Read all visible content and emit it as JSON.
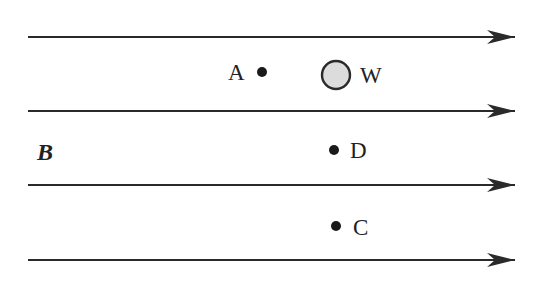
{
  "diagram": {
    "field_label": "B",
    "field_lines": [
      {
        "y": 37
      },
      {
        "y": 111
      },
      {
        "y": 185
      },
      {
        "y": 260
      }
    ],
    "wire": {
      "label": "W",
      "cx": 336,
      "cy": 75,
      "r": 14
    },
    "points": [
      {
        "label": "A",
        "x": 262,
        "y": 72
      },
      {
        "label": "D",
        "x": 334,
        "y": 150
      },
      {
        "label": "C",
        "x": 336,
        "y": 226
      }
    ],
    "colors": {
      "line": "#2a2a2a",
      "wire_fill": "#d8d8d8"
    }
  }
}
